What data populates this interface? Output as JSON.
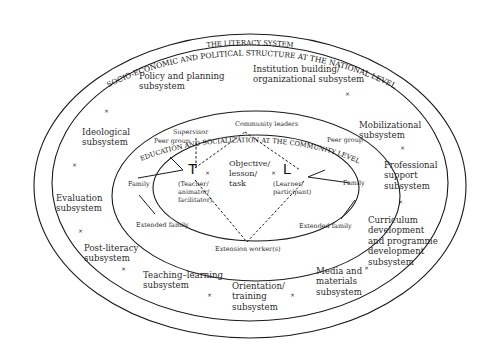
{
  "diagram": {
    "title_outer": "SOCIO-ECONOMIC AND POLITICAL STRUCTURE AT THE NATIONAL LEVEL",
    "title_literacy": "THE LITERACY SYSTEM",
    "title_community": "EDUCATION AND SOCIALIZATION AT THE COMMUNITY LEVEL",
    "subsystems": {
      "policy": "Policy and planning\nsubsystem",
      "institution": "Institution building/\norganizational subsystem",
      "ideological": "Ideological\nsubsystem",
      "mobilizational": "Mobilizational\nsubsystem",
      "professional": "Professional\nsupport\nsubsystem",
      "evaluation": "Evaluation\nsubsystem",
      "curriculum": "Curriculum\ndevelopment\nand programme\ndevelopment\nsubsystem",
      "postliteracy": "Post-literacy\nsubsystem",
      "teaching": "Teaching–learning\nsubsystem",
      "orientation": "Orientation/\ntraining\nsubsystem",
      "media": "Media and\nmaterials\nsubsystem"
    },
    "community": {
      "supervisor": "Supervisor",
      "community_leaders": "Community leaders",
      "peer_group_left": "Peer group",
      "peer_group_right": "Peer group",
      "family_left": "Family",
      "family_right": "Family",
      "extended_family_left": "Extended family",
      "extended_family_right": "Extended family",
      "extension_workers": "Extension worker(s)"
    },
    "core": {
      "teacher_letter": "T",
      "learner_letter": "L",
      "teacher_desc": "(Teacher/\nanimator/\nfacilitator)",
      "learner_desc": "(Learner/\nparticipant)",
      "objective": "Objective/\nlesson/\ntask"
    },
    "marker_symbol": "×",
    "colors": {
      "line": "#1a1a1a",
      "text": "#2b2b2b",
      "background": "#ffffff"
    }
  }
}
